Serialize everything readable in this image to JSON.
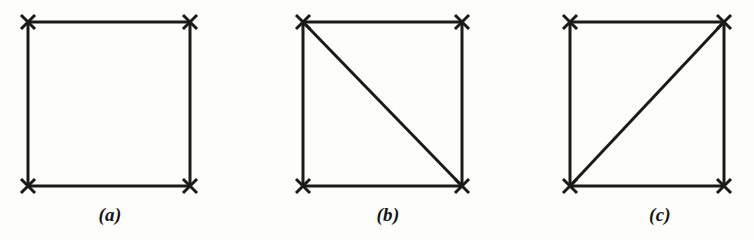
{
  "figure": {
    "background_color": "#fdfdfc",
    "ink_color": "#1a1a1a",
    "stroke_width": 3,
    "vertex_marker": "x-cross",
    "vertex_marker_size": 14,
    "canvas": {
      "width": 754,
      "height": 240
    }
  },
  "panels": [
    {
      "id": "panel-a",
      "caption": "(a)",
      "caption_x": 110,
      "caption_y": 204,
      "square": {
        "left": 28,
        "top": 22,
        "right": 190,
        "bottom": 186
      },
      "vertices": [
        {
          "name": "top-left",
          "x": 28,
          "y": 22
        },
        {
          "name": "top-right",
          "x": 190,
          "y": 22
        },
        {
          "name": "bottom-left",
          "x": 28,
          "y": 186
        },
        {
          "name": "bottom-right",
          "x": 190,
          "y": 186
        }
      ],
      "edges": [
        {
          "name": "top",
          "x1": 28,
          "y1": 22,
          "x2": 190,
          "y2": 22
        },
        {
          "name": "right",
          "x1": 190,
          "y1": 22,
          "x2": 190,
          "y2": 186
        },
        {
          "name": "bottom",
          "x1": 28,
          "y1": 186,
          "x2": 190,
          "y2": 186
        },
        {
          "name": "left",
          "x1": 28,
          "y1": 22,
          "x2": 28,
          "y2": 186
        }
      ],
      "diagonal": null
    },
    {
      "id": "panel-b",
      "caption": "(b)",
      "caption_x": 388,
      "caption_y": 204,
      "square": {
        "left": 303,
        "top": 22,
        "right": 462,
        "bottom": 186
      },
      "vertices": [
        {
          "name": "top-left",
          "x": 303,
          "y": 22
        },
        {
          "name": "top-right",
          "x": 462,
          "y": 22
        },
        {
          "name": "bottom-left",
          "x": 303,
          "y": 186
        },
        {
          "name": "bottom-right",
          "x": 462,
          "y": 186
        }
      ],
      "edges": [
        {
          "name": "top",
          "x1": 303,
          "y1": 22,
          "x2": 462,
          "y2": 22
        },
        {
          "name": "right",
          "x1": 462,
          "y1": 22,
          "x2": 462,
          "y2": 186
        },
        {
          "name": "bottom",
          "x1": 303,
          "y1": 186,
          "x2": 462,
          "y2": 186
        },
        {
          "name": "left",
          "x1": 303,
          "y1": 22,
          "x2": 303,
          "y2": 186
        }
      ],
      "diagonal": {
        "name": "diagonal-tl-br",
        "x1": 303,
        "y1": 22,
        "x2": 462,
        "y2": 186
      }
    },
    {
      "id": "panel-c",
      "caption": "(c)",
      "caption_x": 660,
      "caption_y": 204,
      "square": {
        "left": 570,
        "top": 22,
        "right": 724,
        "bottom": 186
      },
      "vertices": [
        {
          "name": "top-left",
          "x": 570,
          "y": 22
        },
        {
          "name": "top-right",
          "x": 724,
          "y": 22
        },
        {
          "name": "bottom-left",
          "x": 570,
          "y": 186
        },
        {
          "name": "bottom-right",
          "x": 724,
          "y": 186
        }
      ],
      "edges": [
        {
          "name": "top",
          "x1": 570,
          "y1": 22,
          "x2": 724,
          "y2": 22
        },
        {
          "name": "right",
          "x1": 724,
          "y1": 22,
          "x2": 724,
          "y2": 186
        },
        {
          "name": "bottom",
          "x1": 570,
          "y1": 186,
          "x2": 724,
          "y2": 186
        },
        {
          "name": "left",
          "x1": 570,
          "y1": 22,
          "x2": 570,
          "y2": 186
        }
      ],
      "diagonal": {
        "name": "diagonal-bl-tr",
        "x1": 570,
        "y1": 186,
        "x2": 724,
        "y2": 22
      }
    }
  ]
}
